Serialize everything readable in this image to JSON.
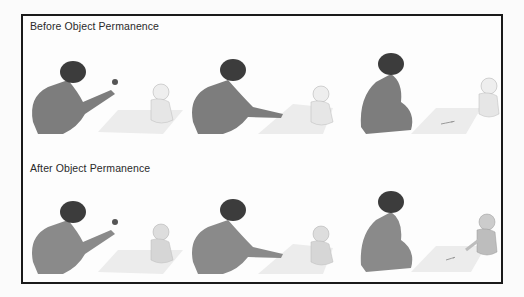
{
  "figure": {
    "rows": [
      {
        "title": "Before Object Permanence",
        "scenes": [
          {
            "step": "adult-shows-toy",
            "baby_state": "looking-at-toy",
            "toy_visible": true
          },
          {
            "step": "adult-hides-toy-under-blanket",
            "baby_state": "watching",
            "toy_visible": false
          },
          {
            "step": "toy-hidden",
            "baby_state": "looks-away-no-search",
            "toy_visible": false
          }
        ]
      },
      {
        "title": "After Object Permanence",
        "scenes": [
          {
            "step": "adult-shows-toy",
            "baby_state": "looking-at-toy",
            "toy_visible": true
          },
          {
            "step": "adult-hides-toy-under-blanket",
            "baby_state": "watching",
            "toy_visible": false
          },
          {
            "step": "toy-hidden",
            "baby_state": "searches-under-blanket",
            "toy_visible": false
          }
        ]
      }
    ],
    "colors": {
      "border": "#1a1a1a",
      "adult": "#7d7d7d",
      "hair": "#3c3c3c",
      "baby": "#e6e6e6",
      "blanket": "#ececec",
      "text": "#2a2a2a"
    }
  }
}
